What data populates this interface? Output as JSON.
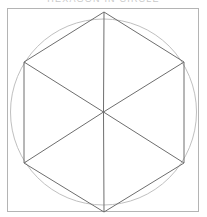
{
  "canvas": {
    "width": 207,
    "height": 217,
    "background": "#ffffff"
  },
  "caption": {
    "text": "HEXAGON IN CIRCLE"
  },
  "figure": {
    "stroke_colors": {
      "frame": "#b4b4b4",
      "circle": "#c0c0c0",
      "hexagon": "#6e6e6e",
      "spoke": "#6e6e6e"
    },
    "stroke_widths": {
      "frame": 1,
      "circle": 1,
      "hexagon": 1,
      "spoke": 1
    },
    "frame": {
      "x": 7,
      "y": 8,
      "width": 192,
      "height": 204
    },
    "circle": {
      "cx": 103.5,
      "cy": 112,
      "r": 93
    },
    "hexagon": {
      "sides": 6,
      "center": {
        "x": 103.5,
        "y": 112
      },
      "circumradius": 93,
      "orientation": "vertex-up",
      "points": "104,12 184,62 184,163 104,212 24,163 24,62",
      "vertices": [
        {
          "label": "top",
          "x": 104,
          "y": 12
        },
        {
          "label": "upper-right",
          "x": 184,
          "y": 62
        },
        {
          "label": "lower-right",
          "x": 184,
          "y": 163
        },
        {
          "label": "bottom",
          "x": 104,
          "y": 212
        },
        {
          "label": "lower-left",
          "x": 24,
          "y": 163
        },
        {
          "label": "upper-left",
          "x": 24,
          "y": 62
        }
      ]
    },
    "spokes": [
      {
        "label": "spoke-to-top",
        "x1": 103.5,
        "y1": 112,
        "x2": 104,
        "y2": 12
      },
      {
        "label": "spoke-to-upper-right",
        "x1": 103.5,
        "y1": 112,
        "x2": 184,
        "y2": 62
      },
      {
        "label": "spoke-to-lower-right",
        "x1": 103.5,
        "y1": 112,
        "x2": 184,
        "y2": 163
      },
      {
        "label": "spoke-to-bottom",
        "x1": 103.5,
        "y1": 112,
        "x2": 104,
        "y2": 212
      },
      {
        "label": "spoke-to-lower-left",
        "x1": 103.5,
        "y1": 112,
        "x2": 24,
        "y2": 163
      },
      {
        "label": "spoke-to-upper-left",
        "x1": 103.5,
        "y1": 112,
        "x2": 24,
        "y2": 62
      }
    ]
  }
}
